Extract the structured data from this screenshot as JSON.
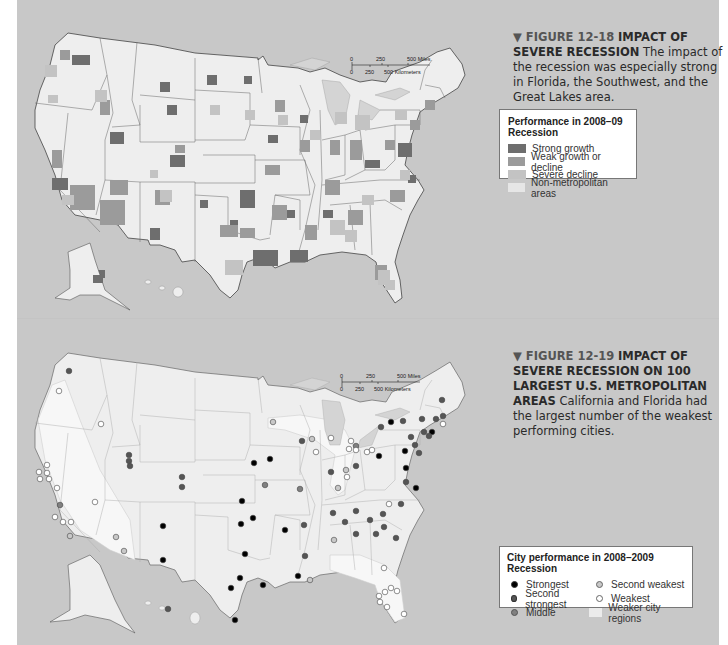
{
  "figure_12_18": {
    "caption": {
      "figure_label": "▼ FIGURE 12-18",
      "title": "IMPACT OF SEVERE RECESSION",
      "body": "The impact of the recession was especially strong in Florida, the Southwest, and the Great Lakes area."
    },
    "scale_bar": {
      "miles_ticks": [
        "0",
        "250",
        "500 Miles"
      ],
      "km_ticks": [
        "0",
        "250",
        "500 Kilometers"
      ]
    },
    "legend": {
      "title": "Performance in 2008–09 Recession",
      "items": [
        {
          "label": "Strong growth",
          "color": "#6e6e6e"
        },
        {
          "label": "Weak growth or decline",
          "color": "#9b9b9b"
        },
        {
          "label": "Severe decline",
          "color": "#c3c3c3"
        },
        {
          "label": "Non-metropolitan areas",
          "color": "#e6e6e6"
        }
      ]
    }
  },
  "figure_12_19": {
    "caption": {
      "figure_label": "▼ FIGURE 12-19",
      "title": "IMPACT OF SEVERE RECESSION ON 100 LARGEST U.S. METROPOLITAN AREAS",
      "body": "California and Florida had the largest number of the weakest performing cities."
    },
    "scale_bar": {
      "miles_ticks": [
        "0",
        "250",
        "500 Miles"
      ],
      "km_ticks": [
        "0",
        "250",
        "500 Kilometers"
      ]
    },
    "legend": {
      "title": "City performance in 2008–2009 Recession",
      "items": [
        {
          "label": "Strongest",
          "color": "#000000"
        },
        {
          "label": "Second weakest",
          "color": "#c8c8c8"
        },
        {
          "label": "Second strongest",
          "color": "#555555"
        },
        {
          "label": "Weakest",
          "color": "#ffffff"
        },
        {
          "label": "Middle",
          "color": "#808080"
        },
        {
          "label": "Weaker city regions",
          "color": "#ebebeb"
        }
      ]
    }
  },
  "colors": {
    "page_background": "#c8c8c8",
    "land": "#eeeeee",
    "water": "#c8c8c8",
    "border": "#555555"
  }
}
